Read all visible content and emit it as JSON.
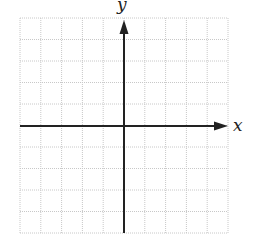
{
  "chart_data": {
    "type": "scatter",
    "title": "",
    "xlabel": "x",
    "ylabel": "y",
    "grid": true,
    "grid_cells": {
      "columns": 10,
      "rows": 10
    },
    "x_range": [
      -5,
      5
    ],
    "y_range": [
      -5,
      5
    ],
    "tick_labels": [],
    "series": [],
    "axes": {
      "origin": [
        0,
        0
      ],
      "arrows": [
        "positive-x",
        "positive-y"
      ]
    }
  },
  "labels": {
    "x": "x",
    "y": "y"
  },
  "colors": {
    "grid": "#c8c8c8",
    "axis": "#222222",
    "background": "#ffffff"
  }
}
